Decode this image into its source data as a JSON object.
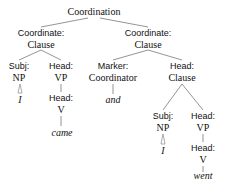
{
  "diagram": {
    "type": "syntax-tree",
    "root": {
      "label": "Coordination",
      "x": 94,
      "y": 12
    },
    "nodes": [
      {
        "id": "lcc_f",
        "text": "Coordinate:",
        "kind": "func",
        "x": 41,
        "y": 33
      },
      {
        "id": "lcc_c",
        "text": "Clause",
        "kind": "cat",
        "x": 41,
        "y": 45
      },
      {
        "id": "rcc_f",
        "text": "Coordinate:",
        "kind": "func",
        "x": 148,
        "y": 33
      },
      {
        "id": "rcc_c",
        "text": "Clause",
        "kind": "cat",
        "x": 148,
        "y": 45
      },
      {
        "id": "lsubj_f",
        "text": "Subj:",
        "kind": "func",
        "x": 19,
        "y": 66
      },
      {
        "id": "lsubj_c",
        "text": "NP",
        "kind": "cat",
        "x": 19,
        "y": 78
      },
      {
        "id": "lhead_f",
        "text": "Head:",
        "kind": "func",
        "x": 61,
        "y": 66
      },
      {
        "id": "lhead_c",
        "text": "VP",
        "kind": "cat",
        "x": 61,
        "y": 78
      },
      {
        "id": "marker_f",
        "text": "Marker:",
        "kind": "func",
        "x": 113,
        "y": 66
      },
      {
        "id": "marker_c",
        "text": "Coordinator",
        "kind": "cat",
        "x": 113,
        "y": 78
      },
      {
        "id": "rhead_f",
        "text": "Head:",
        "kind": "func",
        "x": 182,
        "y": 66
      },
      {
        "id": "rhead_c",
        "text": "Clause",
        "kind": "cat",
        "x": 182,
        "y": 78
      },
      {
        "id": "lI",
        "text": "I",
        "kind": "word",
        "x": 20,
        "y": 100
      },
      {
        "id": "lvh_f",
        "text": "Head:",
        "kind": "func",
        "x": 61,
        "y": 98
      },
      {
        "id": "lvh_c",
        "text": "V",
        "kind": "cat",
        "x": 61,
        "y": 110
      },
      {
        "id": "came",
        "text": "came",
        "kind": "word",
        "x": 62,
        "y": 133
      },
      {
        "id": "and",
        "text": "and",
        "kind": "word",
        "x": 113,
        "y": 100
      },
      {
        "id": "rsubj_f",
        "text": "Subj:",
        "kind": "func",
        "x": 163,
        "y": 116
      },
      {
        "id": "rsubj_c",
        "text": "NP",
        "kind": "cat",
        "x": 163,
        "y": 128
      },
      {
        "id": "rvp_f",
        "text": "Head:",
        "kind": "func",
        "x": 203,
        "y": 116
      },
      {
        "id": "rvp_c",
        "text": "VP",
        "kind": "cat",
        "x": 203,
        "y": 128
      },
      {
        "id": "rI",
        "text": "I",
        "kind": "word",
        "x": 163,
        "y": 151
      },
      {
        "id": "rvh_f",
        "text": "Head:",
        "kind": "func",
        "x": 203,
        "y": 148
      },
      {
        "id": "rvh_c",
        "text": "V",
        "kind": "cat",
        "x": 203,
        "y": 160
      },
      {
        "id": "went",
        "text": "went",
        "kind": "word",
        "x": 203,
        "y": 178
      }
    ]
  },
  "labels": {
    "root": "Coordination",
    "coordinate": "Coordinate:",
    "clause": "Clause",
    "subj": "Subj:",
    "head": "Head:",
    "marker": "Marker:",
    "np": "NP",
    "vp": "VP",
    "v": "V",
    "coordinator": "Coordinator",
    "w_I": "I",
    "w_came": "came",
    "w_and": "and",
    "w_went": "went"
  }
}
